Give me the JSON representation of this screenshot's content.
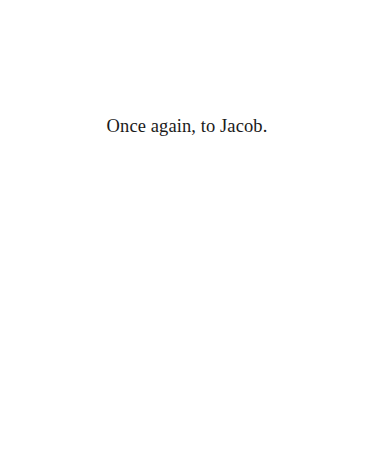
{
  "page": {
    "type": "dedication",
    "dedication_text": "Once again, to Jacob."
  }
}
